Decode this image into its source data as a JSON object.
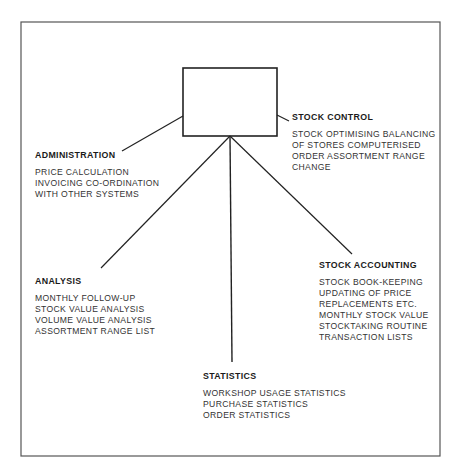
{
  "diagram": {
    "center_box": {
      "label": ""
    },
    "nodes": [
      {
        "id": "administration",
        "title": "ADMINISTRATION",
        "items": [
          "PRICE CALCULATION",
          "INVOICING CO-ORDINATION",
          "WITH OTHER SYSTEMS"
        ]
      },
      {
        "id": "stock_control",
        "title": "STOCK CONTROL",
        "items": [
          "STOCK OPTIMISING BALANCING",
          "OF STORES COMPUTERISED",
          "ORDER ASSORTMENT RANGE",
          "CHANGE"
        ]
      },
      {
        "id": "analysis",
        "title": "ANALYSIS",
        "items": [
          "MONTHLY FOLLOW-UP",
          "STOCK VALUE ANALYSIS",
          "VOLUME VALUE ANALYSIS",
          "ASSORTMENT RANGE LIST"
        ]
      },
      {
        "id": "stock_accounting",
        "title": "STOCK ACCOUNTING",
        "items": [
          "STOCK BOOK-KEEPING",
          "UPDATING OF PRICE",
          "REPLACEMENTS ETC.",
          "MONTHLY STOCK VALUE",
          "STOCKTAKING ROUTINE",
          "TRANSACTION LISTS"
        ]
      },
      {
        "id": "statistics",
        "title": "STATISTICS",
        "items": [
          "WORKSHOP USAGE STATISTICS",
          "PURCHASE STATISTICS",
          "ORDER STATISTICS"
        ]
      }
    ],
    "colors": {
      "line": "#222222",
      "frame": "#555555",
      "background": "#ffffff"
    }
  }
}
